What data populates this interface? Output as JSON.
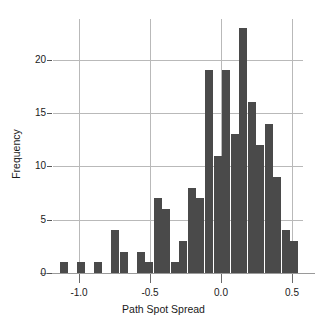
{
  "chart_data": {
    "type": "bar",
    "title": "",
    "subtitle": "",
    "xlabel": "Path Spot Spread",
    "ylabel": "Frequency",
    "xlim": [
      -1.18,
      0.58
    ],
    "ylim": [
      0,
      23.8
    ],
    "grid": true,
    "legend": null,
    "bin_width": 0.06,
    "xticks": [
      -1.0,
      -0.5,
      0.0,
      0.5
    ],
    "xtick_labels": [
      "-1.0",
      "-0.5",
      "0.0",
      "0.5"
    ],
    "yticks": [
      0,
      5,
      10,
      15,
      20
    ],
    "ytick_labels": [
      "0",
      "5",
      "10",
      "15",
      "20"
    ],
    "bar_color": "#4a4a4a",
    "grid_color": "#b9b9b9",
    "axis_color": "#9a9a9a",
    "bin_centers": [
      -1.1,
      -1.04,
      -0.98,
      -0.92,
      -0.86,
      -0.8,
      -0.74,
      -0.68,
      -0.62,
      -0.56,
      -0.5,
      -0.44,
      -0.38,
      -0.32,
      -0.26,
      -0.2,
      -0.14,
      -0.08,
      -0.02,
      0.04,
      0.1,
      0.16,
      0.22,
      0.28,
      0.34,
      0.4,
      0.46,
      0.52
    ],
    "values": [
      1,
      0,
      1,
      0,
      1,
      0,
      4,
      2,
      0,
      2,
      1,
      7,
      6,
      1,
      3,
      8,
      7,
      19,
      11,
      19,
      13,
      23,
      16,
      12,
      14,
      9,
      4,
      3
    ],
    "series": [
      {
        "name": "Frequency",
        "values": [
          1,
          0,
          1,
          0,
          1,
          0,
          4,
          2,
          0,
          2,
          1,
          7,
          6,
          1,
          3,
          8,
          7,
          19,
          11,
          19,
          13,
          23,
          16,
          12,
          14,
          9,
          4,
          3
        ]
      }
    ],
    "annotations": []
  }
}
